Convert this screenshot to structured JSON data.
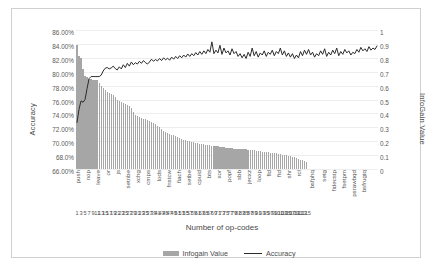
{
  "chart_data": {
    "type": "bar",
    "title": "",
    "xlabel": "Number of op-codes",
    "ylabel": "Accuracy",
    "y2label": "InfoGain Value",
    "ylim": [
      66,
      86
    ],
    "y2lim": [
      0,
      1
    ],
    "grid": true,
    "legend_position": "bottom",
    "y_ticks": [
      "66.00%",
      "68.0%",
      "70.00%",
      "72.00%",
      "74.00%",
      "76.00%",
      "78.00%",
      "80.00%",
      "82.00%",
      "84.00%",
      "86.00%"
    ],
    "y2_ticks": [
      "0",
      "0.1",
      "0.2",
      "0.3",
      "0.4",
      "0.5",
      "0.6",
      "0.7",
      "0.8",
      "0.9",
      "1"
    ],
    "x_tick_labels": [
      "1",
      "3",
      "5",
      "7",
      "9",
      "11",
      "13",
      "15",
      "17",
      "19",
      "21",
      "23",
      "25",
      "27",
      "29",
      "31",
      "33",
      "35",
      "37",
      "39",
      "41",
      "43",
      "45",
      "47",
      "49",
      "51",
      "53",
      "55",
      "57",
      "59",
      "61",
      "63",
      "65",
      "67",
      "69",
      "71",
      "73",
      "75",
      "77",
      "79",
      "81",
      "83",
      "85",
      "87",
      "89",
      "91",
      "93",
      "95",
      "97",
      "99",
      "101",
      "103",
      "105",
      "107",
      "109",
      "111",
      "113",
      "115"
    ],
    "category_labels": [
      {
        "index": 1,
        "label": "push"
      },
      {
        "index": 6,
        "label": "nop"
      },
      {
        "index": 11,
        "label": "leave"
      },
      {
        "index": 16,
        "label": "or"
      },
      {
        "index": 21,
        "label": "js"
      },
      {
        "index": 26,
        "label": "setnbe"
      },
      {
        "index": 31,
        "label": "xchg"
      },
      {
        "index": 36,
        "label": "cmps"
      },
      {
        "index": 41,
        "label": "lods"
      },
      {
        "index": 46,
        "label": "fnstcw"
      },
      {
        "index": 51,
        "label": "fiach"
      },
      {
        "index": 56,
        "label": "setbe"
      },
      {
        "index": 61,
        "label": "cpuid"
      },
      {
        "index": 66,
        "label": "bts"
      },
      {
        "index": 71,
        "label": "xor"
      },
      {
        "index": 76,
        "label": "popf"
      },
      {
        "index": 81,
        "label": "sbb"
      },
      {
        "index": 86,
        "label": "jecxz"
      },
      {
        "index": 91,
        "label": "loop"
      },
      {
        "index": 96,
        "label": "fld"
      },
      {
        "index": 101,
        "label": "ftd"
      },
      {
        "index": 106,
        "label": "shr"
      },
      {
        "index": 111,
        "label": "rcl"
      },
      {
        "index": 117,
        "label": "bsfphq"
      },
      {
        "index": 123,
        "label": "setg"
      },
      {
        "index": 128,
        "label": "fidecstp"
      },
      {
        "index": 133,
        "label": "fsetpm"
      },
      {
        "index": 138,
        "label": "psrawbqd"
      },
      {
        "index": 143,
        "label": "bsfrugtq"
      }
    ],
    "series": [
      {
        "name": "Infogain Value",
        "kind": "bar",
        "color": "#a6a6a6",
        "axis": "right",
        "values": [
          0.893,
          0.812,
          0.8,
          0.722,
          0.672,
          0.665,
          0.65,
          0.647,
          0.643,
          0.64,
          0.637,
          0.618,
          0.598,
          0.58,
          0.566,
          0.552,
          0.545,
          0.54,
          0.533,
          0.518,
          0.5,
          0.486,
          0.482,
          0.477,
          0.47,
          0.462,
          0.455,
          0.44,
          0.412,
          0.392,
          0.382,
          0.375,
          0.37,
          0.362,
          0.357,
          0.352,
          0.345,
          0.338,
          0.33,
          0.322,
          0.312,
          0.3,
          0.288,
          0.276,
          0.268,
          0.262,
          0.255,
          0.248,
          0.243,
          0.238,
          0.232,
          0.226,
          0.218,
          0.212,
          0.208,
          0.203,
          0.2,
          0.196,
          0.192,
          0.188,
          0.186,
          0.183,
          0.18,
          0.178,
          0.176,
          0.173,
          0.17,
          0.168,
          0.166,
          0.164,
          0.162,
          0.16,
          0.158,
          0.156,
          0.154,
          0.152,
          0.15,
          0.148,
          0.147,
          0.146,
          0.145,
          0.144,
          0.143,
          0.142,
          0.141,
          0.14,
          0.138,
          0.136,
          0.134,
          0.132,
          0.13,
          0.128,
          0.126,
          0.124,
          0.122,
          0.12,
          0.118,
          0.116,
          0.114,
          0.112,
          0.11,
          0.107,
          0.104,
          0.101,
          0.098,
          0.095,
          0.092,
          0.089,
          0.085,
          0.08,
          0.074,
          0.068,
          0.062,
          0.056,
          0.05,
          0,
          0,
          0,
          0,
          0,
          0,
          0,
          0,
          0,
          0,
          0,
          0,
          0,
          0,
          0,
          0,
          0,
          0,
          0,
          0,
          0,
          0,
          0,
          0,
          0,
          0,
          0,
          0,
          0
        ]
      },
      {
        "name": "Accuracy",
        "kind": "line",
        "color": "#2b2b2b",
        "axis": "left",
        "values": [
          72.7,
          74.6,
          75.8,
          75.6,
          76.0,
          77.6,
          79.0,
          79.3,
          79.3,
          79.3,
          79.3,
          79.3,
          79.5,
          80.1,
          80.5,
          80.6,
          80.4,
          80.55,
          80.8,
          80.45,
          80.25,
          80.7,
          80.4,
          81.0,
          80.6,
          81.2,
          80.8,
          81.4,
          81.0,
          81.3,
          81.1,
          81.5,
          81.2,
          81.6,
          81.3,
          81.1,
          81.4,
          81.8,
          81.5,
          81.75,
          81.55,
          81.9,
          81.6,
          82.0,
          81.7,
          81.95,
          81.65,
          82.1,
          81.8,
          82.2,
          81.9,
          82.3,
          82.0,
          82.4,
          82.1,
          82.55,
          82.2,
          82.6,
          82.3,
          82.75,
          82.4,
          82.9,
          82.5,
          83.0,
          82.6,
          83.2,
          82.8,
          84.3,
          82.6,
          83.1,
          82.7,
          83.8,
          82.5,
          83.4,
          82.7,
          83.0,
          82.4,
          83.3,
          82.6,
          82.9,
          82.2,
          82.6,
          82.0,
          82.5,
          81.9,
          82.8,
          82.2,
          83.4,
          82.3,
          82.9,
          82.1,
          82.7,
          82.4,
          83.0,
          82.2,
          82.8,
          82.5,
          83.1,
          82.3,
          82.9,
          82.6,
          83.4,
          82.4,
          83.0,
          82.2,
          82.7,
          82.1,
          82.6,
          81.9,
          82.4,
          82.0,
          82.9,
          82.3,
          83.1,
          82.5,
          83.2,
          82.4,
          82.8,
          82.1,
          82.6,
          82.3,
          83.0,
          82.5,
          83.3,
          82.2,
          82.8,
          82.4,
          83.1,
          82.6,
          83.4,
          82.3,
          82.9,
          82.5,
          83.2,
          82.7,
          83.0,
          82.4,
          82.8,
          82.6,
          83.2,
          82.8,
          83.5,
          83.0,
          83.3,
          82.9,
          83.6,
          83.1,
          83.4,
          83.2,
          83.7
        ]
      }
    ]
  },
  "legend": {
    "items": [
      {
        "label": "Infogain Value",
        "marker": "bar-swatch"
      },
      {
        "label": "Accuracy",
        "marker": "line-swatch"
      }
    ]
  }
}
